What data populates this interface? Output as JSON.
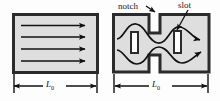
{
  "figure": {
    "type": "technical-schematic",
    "panels": [
      {
        "id": "plain-channel",
        "name": "plain channel",
        "fill_color": "#dedede",
        "border_color": "#2b2b2b",
        "flow": {
          "style": "straight",
          "arrow_count": 4,
          "direction": "left-to-right"
        },
        "dimension": {
          "label": "L",
          "subscript": "0",
          "position": "below"
        }
      },
      {
        "id": "notched-slotted-channel",
        "name": "notched and slotted channel",
        "fill_color": "#dedede",
        "border_color": "#2b2b2b",
        "features": [
          {
            "label": "notch",
            "count": 2,
            "location": "top and bottom edge"
          },
          {
            "label": "slot",
            "count": 2,
            "location": "interior, vertical"
          }
        ],
        "flow": {
          "style": "wavy",
          "arrow_count": 2,
          "direction": "left-to-right"
        },
        "dimension": {
          "label": "L",
          "subscript": "0",
          "position": "below"
        }
      }
    ],
    "callouts": [
      {
        "text": "notch",
        "x": 118,
        "y": 2
      },
      {
        "text": "slot",
        "x": 178,
        "y": 1
      }
    ]
  }
}
